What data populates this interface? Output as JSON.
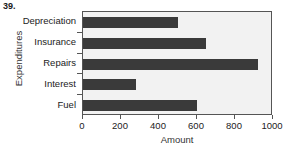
{
  "problem": {
    "number": "39."
  },
  "chart_data": {
    "type": "bar",
    "orientation": "horizontal",
    "title": "",
    "xlabel": "Amount",
    "ylabel": "Expenditures",
    "categories": [
      "Depreciation",
      "Insurance",
      "Repairs",
      "Interest",
      "Fuel"
    ],
    "values": [
      500,
      645,
      920,
      280,
      600
    ],
    "xlim": [
      0,
      1000
    ],
    "xticks": [
      0,
      200,
      400,
      600,
      800,
      1000
    ],
    "xtick_labels": [
      "0",
      "200",
      "400",
      "600",
      "800",
      "1000"
    ],
    "grid": false,
    "legend": false,
    "bar_color": "#3a3a3a",
    "plot_background": "#f2f2f2",
    "axis_color": "#555555"
  }
}
